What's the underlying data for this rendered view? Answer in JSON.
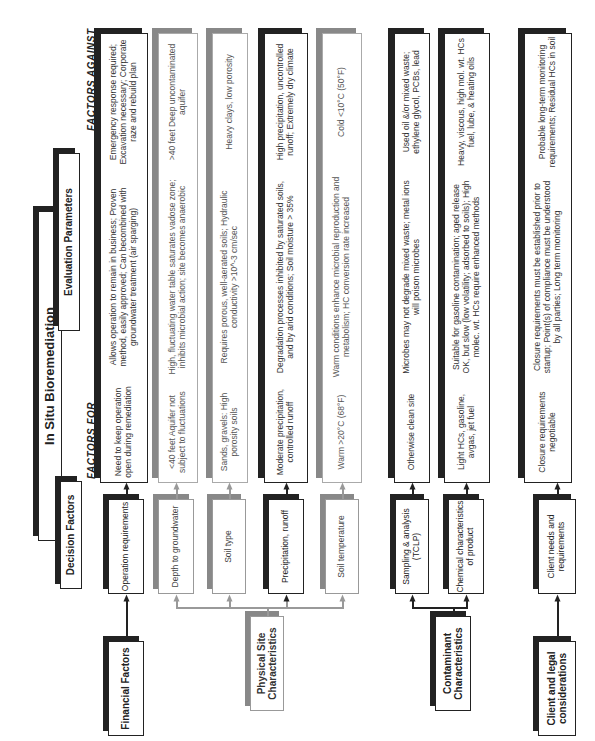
{
  "title": "In Situ Bioremediation",
  "headers": {
    "decision_factors": "Decision Factors",
    "evaluation_parameters": "Evaluation Parameters",
    "factors_for": "FACTORS FOR",
    "factors_against": "FACTORS AGAINST"
  },
  "categories": [
    {
      "id": "financial",
      "label": "Financial Factors"
    },
    {
      "id": "physical",
      "label": "Physical Site Characteristics"
    },
    {
      "id": "contaminant",
      "label": "Contaminant Characteristics"
    },
    {
      "id": "client",
      "label": "Client and legal considerations"
    }
  ],
  "rows": [
    {
      "factor": "Operation requirements",
      "for": "Need to keep operation open during remediation",
      "evaluation": "Allows operation to remain in business; Proven method, easily approved; Can becombined with groundwater treatment (air sparging)",
      "against": "Emergency response required; Excavation necessary; Corporate raze and rebuild plan"
    },
    {
      "factor": "Depth to groundwater",
      "for": "<40 feet Aquifer not subject to fluctuations",
      "evaluation": "High, fluctuating water table saturates vadose zone; inhibits microbial action; site becomes anaerobic",
      "against": ">40 feet Deep uncontaminated aquifer"
    },
    {
      "factor": "Soil type",
      "for": "Sands, gravels: High porosity soils",
      "evaluation": "Requires porous, well-aerated soils; Hydraulic conductivity >10^-3 cm/sec",
      "against": "Heavy clays, low porosity"
    },
    {
      "factor": "Precipitation, runoff",
      "for": "Moderate precipitation, controlled runoff",
      "evaluation": "Degradation processes inhibited by saturated soils, and by arid conditions; Soil moisture > 35%",
      "against": "High precipitation, uncontrolled runoff; Extremely dry climate"
    },
    {
      "factor": "Soil temperature",
      "for": "Warm >20°C (68°F)",
      "evaluation": "Warm conditions enhance microbial reproduction and metabolism; HC conversion rate increased",
      "against": "Cold <10°C (50°F)"
    },
    {
      "factor": "Sampling & analysis (TCLP)",
      "for": "Otherwise clean site",
      "evaluation": "Microbes may not degrade mixed waste; metal ions will poison microbes",
      "against": "Used oil &/or mixed waste; ethylene glycol, PCBs, lead"
    },
    {
      "factor": "Chemical characteristics of product",
      "for": "Light HCs, gasoline, avgas, jet fuel",
      "evaluation": "Suitable for gasoline contamination; aged release OK, but slow (low volatility; adsorbed to soils); High molec. wt. HCs require enhanced methods",
      "against": "Heavy, viscous, high mol. wt. HCs fuel, lube, & heating oils"
    },
    {
      "factor": "Client needs and requirements",
      "for": "Closure requirements negotiable",
      "evaluation": "Closure requirements must be established prior to startup; Point(s) of compliance must be understood by all parties; Long term monitoring",
      "against": "Probable long-term monitoring requirements; Residual HCs in soil"
    }
  ]
}
